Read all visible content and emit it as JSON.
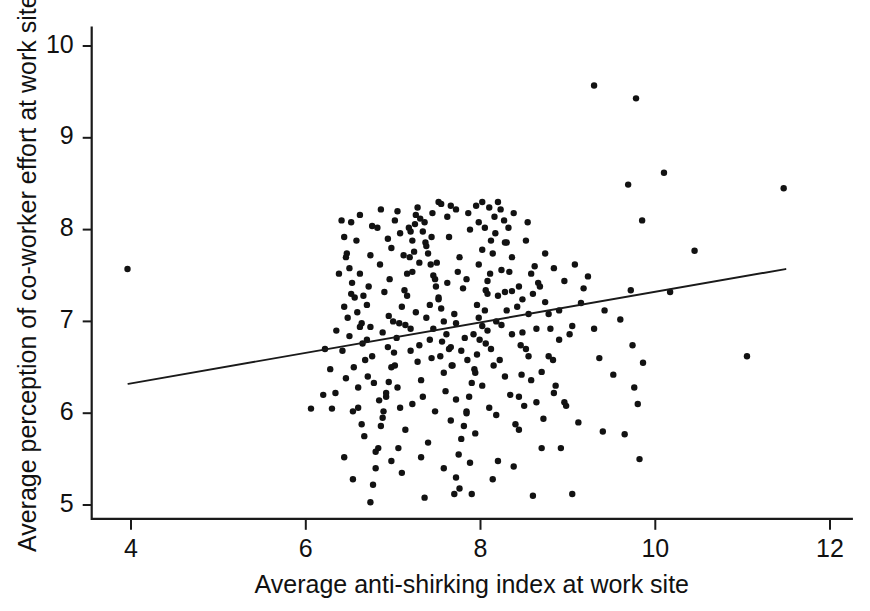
{
  "chart_data": {
    "type": "scatter",
    "title": "",
    "xlabel": "Average anti-shirking index at work site",
    "ylabel": "Average perception of co-worker effort at work site",
    "xlim": [
      3.55,
      12.25
    ],
    "ylim": [
      4.85,
      10.2
    ],
    "xticks": [
      4,
      6,
      8,
      10,
      12
    ],
    "xtick_labels": [
      "4",
      "6",
      "8",
      "10",
      "12"
    ],
    "yticks": [
      5,
      6,
      7,
      8,
      9,
      10
    ],
    "ytick_labels": [
      "5",
      "6",
      "7",
      "8",
      "9",
      "10"
    ],
    "grid": false,
    "legend": null,
    "marker": {
      "shape": "circle",
      "color": "#121212",
      "size_px": 6.4
    },
    "trendline": {
      "type": "linear",
      "color": "#1a1a1a",
      "x_start": 3.97,
      "y_start": 6.32,
      "x_end": 11.49,
      "y_end": 7.57,
      "slope": 0.166,
      "intercept": 5.66
    },
    "n_points": 305,
    "points": [
      [
        3.96,
        7.57
      ],
      [
        9.3,
        9.57
      ],
      [
        9.78,
        9.43
      ],
      [
        10.1,
        8.62
      ],
      [
        9.69,
        8.49
      ],
      [
        11.47,
        8.45
      ],
      [
        9.85,
        8.1
      ],
      [
        10.45,
        7.77
      ],
      [
        9.23,
        7.49
      ],
      [
        9.72,
        7.34
      ],
      [
        10.17,
        7.32
      ],
      [
        9.6,
        7.02
      ],
      [
        9.74,
        6.74
      ],
      [
        11.05,
        6.62
      ],
      [
        9.86,
        6.55
      ],
      [
        9.76,
        6.28
      ],
      [
        9.8,
        6.1
      ],
      [
        9.65,
        5.77
      ],
      [
        9.82,
        5.5
      ],
      [
        9.05,
        5.12
      ],
      [
        8.98,
        6.08
      ],
      [
        8.86,
        6.3
      ],
      [
        8.83,
        6.58
      ],
      [
        8.8,
        6.92
      ],
      [
        8.74,
        7.21
      ],
      [
        8.66,
        7.42
      ],
      [
        8.62,
        7.6
      ],
      [
        8.55,
        7.08
      ],
      [
        8.52,
        6.7
      ],
      [
        8.47,
        6.42
      ],
      [
        8.44,
        6.18
      ],
      [
        8.4,
        5.88
      ],
      [
        8.92,
        5.62
      ],
      [
        8.36,
        7.33
      ],
      [
        8.33,
        7.54
      ],
      [
        8.3,
        7.86
      ],
      [
        8.27,
        8.1
      ],
      [
        8.23,
        8.22
      ],
      [
        8.2,
        8.3
      ],
      [
        8.17,
        7.96
      ],
      [
        8.14,
        7.74
      ],
      [
        8.11,
        7.52
      ],
      [
        8.08,
        7.3
      ],
      [
        8.05,
        7.12
      ],
      [
        8.02,
        6.95
      ],
      [
        7.99,
        6.8
      ],
      [
        7.96,
        6.64
      ],
      [
        7.93,
        6.48
      ],
      [
        7.9,
        6.33
      ],
      [
        7.87,
        6.18
      ],
      [
        7.84,
        6.02
      ],
      [
        7.81,
        5.86
      ],
      [
        7.78,
        5.72
      ],
      [
        7.75,
        5.55
      ],
      [
        7.72,
        5.3
      ],
      [
        7.7,
        5.12
      ],
      [
        7.67,
        6.52
      ],
      [
        7.64,
        6.7
      ],
      [
        7.61,
        6.86
      ],
      [
        7.58,
        7.0
      ],
      [
        7.55,
        7.14
      ],
      [
        7.52,
        7.26
      ],
      [
        7.49,
        7.38
      ],
      [
        7.46,
        7.5
      ],
      [
        7.43,
        7.62
      ],
      [
        7.4,
        7.74
      ],
      [
        7.37,
        7.86
      ],
      [
        7.34,
        7.98
      ],
      [
        7.31,
        8.12
      ],
      [
        7.28,
        8.24
      ],
      [
        7.25,
        8.06
      ],
      [
        7.22,
        7.88
      ],
      [
        7.19,
        7.7
      ],
      [
        7.16,
        7.52
      ],
      [
        7.13,
        7.34
      ],
      [
        7.1,
        7.16
      ],
      [
        7.07,
        6.98
      ],
      [
        7.04,
        6.82
      ],
      [
        7.01,
        6.66
      ],
      [
        6.98,
        6.5
      ],
      [
        6.95,
        6.34
      ],
      [
        6.92,
        6.18
      ],
      [
        6.89,
        6.02
      ],
      [
        6.86,
        5.86
      ],
      [
        6.83,
        5.62
      ],
      [
        6.8,
        5.4
      ],
      [
        6.77,
        5.22
      ],
      [
        6.74,
        5.03
      ],
      [
        6.71,
        6.4
      ],
      [
        6.68,
        6.58
      ],
      [
        6.65,
        6.76
      ],
      [
        6.62,
        6.94
      ],
      [
        6.59,
        7.1
      ],
      [
        6.56,
        7.26
      ],
      [
        6.53,
        7.42
      ],
      [
        6.5,
        7.58
      ],
      [
        6.47,
        7.74
      ],
      [
        6.44,
        7.92
      ],
      [
        6.41,
        8.1
      ],
      [
        6.3,
        6.05
      ],
      [
        6.06,
        6.05
      ],
      [
        6.2,
        6.2
      ],
      [
        7.05,
        8.2
      ],
      [
        7.55,
        8.28
      ],
      [
        7.95,
        8.26
      ],
      [
        8.05,
        8.02
      ],
      [
        7.45,
        8.18
      ],
      [
        7.3,
        7.64
      ],
      [
        8.6,
        7.3
      ],
      [
        8.3,
        7.12
      ],
      [
        8.15,
        6.52
      ],
      [
        8.5,
        6.08
      ],
      [
        8.7,
        6.45
      ],
      [
        8.9,
        6.8
      ],
      [
        9.05,
        6.95
      ],
      [
        9.15,
        7.2
      ],
      [
        8.2,
        5.48
      ],
      [
        7.9,
        5.12
      ],
      [
        7.1,
        5.35
      ],
      [
        6.98,
        5.48
      ],
      [
        6.67,
        5.75
      ],
      [
        6.6,
        6.06
      ],
      [
        6.92,
        6.22
      ],
      [
        7.22,
        6.1
      ],
      [
        7.48,
        6.02
      ],
      [
        7.72,
        6.15
      ],
      [
        8.02,
        6.3
      ],
      [
        8.28,
        6.4
      ],
      [
        8.55,
        6.62
      ],
      [
        8.12,
        6.7
      ],
      [
        7.85,
        6.58
      ],
      [
        7.58,
        6.44
      ],
      [
        7.32,
        6.36
      ],
      [
        7.05,
        6.28
      ],
      [
        6.78,
        6.33
      ],
      [
        6.55,
        6.5
      ],
      [
        6.42,
        6.68
      ],
      [
        6.35,
        6.9
      ],
      [
        6.48,
        7.04
      ],
      [
        6.7,
        7.18
      ],
      [
        6.95,
        7.06
      ],
      [
        7.2,
        6.92
      ],
      [
        7.42,
        6.8
      ],
      [
        7.66,
        6.72
      ],
      [
        7.92,
        6.86
      ],
      [
        8.18,
        7.0
      ],
      [
        8.42,
        7.16
      ],
      [
        8.08,
        7.44
      ],
      [
        7.8,
        7.36
      ],
      [
        7.52,
        7.24
      ],
      [
        7.26,
        7.1
      ],
      [
        7.0,
        7.0
      ],
      [
        6.74,
        6.94
      ],
      [
        6.52,
        7.3
      ],
      [
        6.62,
        7.52
      ],
      [
        6.85,
        7.62
      ],
      [
        7.12,
        7.72
      ],
      [
        7.38,
        7.82
      ],
      [
        7.64,
        7.92
      ],
      [
        7.88,
        8.0
      ],
      [
        8.12,
        7.88
      ],
      [
        8.36,
        7.7
      ],
      [
        8.58,
        7.52
      ],
      [
        8.44,
        7.38
      ],
      [
        8.24,
        7.56
      ],
      [
        7.98,
        7.62
      ],
      [
        7.74,
        7.54
      ],
      [
        7.48,
        7.46
      ],
      [
        7.22,
        7.54
      ],
      [
        6.96,
        7.46
      ],
      [
        6.72,
        7.38
      ],
      [
        6.58,
        7.88
      ],
      [
        6.82,
        8.02
      ],
      [
        7.08,
        7.96
      ],
      [
        7.36,
        8.08
      ],
      [
        7.62,
        8.14
      ],
      [
        7.86,
        8.18
      ],
      [
        8.1,
        8.24
      ],
      [
        7.44,
        6.6
      ],
      [
        7.68,
        6.52
      ],
      [
        7.94,
        6.44
      ],
      [
        8.22,
        6.58
      ],
      [
        8.46,
        6.74
      ],
      [
        8.64,
        6.92
      ],
      [
        8.78,
        7.08
      ],
      [
        8.36,
        6.86
      ],
      [
        8.06,
        6.76
      ],
      [
        7.78,
        6.68
      ],
      [
        7.54,
        6.62
      ],
      [
        7.28,
        6.56
      ],
      [
        7.02,
        6.52
      ],
      [
        6.76,
        6.62
      ],
      [
        6.5,
        6.84
      ],
      [
        6.44,
        7.16
      ],
      [
        6.66,
        7.28
      ],
      [
        6.9,
        7.32
      ],
      [
        7.16,
        7.28
      ],
      [
        7.42,
        7.18
      ],
      [
        7.7,
        7.08
      ],
      [
        7.96,
        7.18
      ],
      [
        8.2,
        7.28
      ],
      [
        8.48,
        7.24
      ],
      [
        8.68,
        7.38
      ],
      [
        8.28,
        7.86
      ],
      [
        8.02,
        7.78
      ],
      [
        7.76,
        7.7
      ],
      [
        7.5,
        7.64
      ],
      [
        7.24,
        7.76
      ],
      [
        6.98,
        7.8
      ],
      [
        6.74,
        7.72
      ],
      [
        6.88,
        5.95
      ],
      [
        7.14,
        5.82
      ],
      [
        7.4,
        5.68
      ],
      [
        7.66,
        5.92
      ],
      [
        7.94,
        5.78
      ],
      [
        8.18,
        5.98
      ],
      [
        8.44,
        5.82
      ],
      [
        8.64,
        6.12
      ],
      [
        8.84,
        6.22
      ],
      [
        6.34,
        6.22
      ],
      [
        6.28,
        6.48
      ],
      [
        6.22,
        6.7
      ],
      [
        6.38,
        7.52
      ],
      [
        6.46,
        7.7
      ],
      [
        6.54,
        6.02
      ],
      [
        6.64,
        5.88
      ],
      [
        6.8,
        5.58
      ],
      [
        7.06,
        5.62
      ],
      [
        7.32,
        5.52
      ],
      [
        7.58,
        5.4
      ],
      [
        7.88,
        5.46
      ],
      [
        8.14,
        5.28
      ],
      [
        8.38,
        5.42
      ],
      [
        8.7,
        5.62
      ],
      [
        7.36,
        5.08
      ],
      [
        6.54,
        5.28
      ],
      [
        6.44,
        5.52
      ],
      [
        8.84,
        7.58
      ],
      [
        8.96,
        7.44
      ],
      [
        9.08,
        7.62
      ],
      [
        8.74,
        7.74
      ],
      [
        8.52,
        7.88
      ],
      [
        8.32,
        8.02
      ],
      [
        8.16,
        8.14
      ],
      [
        7.98,
        8.08
      ],
      [
        7.72,
        8.22
      ],
      [
        7.52,
        8.3
      ],
      [
        7.26,
        8.16
      ],
      [
        7.02,
        8.1
      ],
      [
        6.76,
        8.04
      ],
      [
        6.62,
        8.16
      ],
      [
        6.52,
        8.08
      ],
      [
        8.9,
        7.12
      ],
      [
        9.02,
        6.86
      ],
      [
        8.78,
        6.62
      ],
      [
        8.58,
        6.36
      ],
      [
        8.34,
        6.2
      ],
      [
        8.1,
        6.06
      ],
      [
        7.84,
        6.0
      ],
      [
        7.6,
        6.24
      ],
      [
        7.34,
        6.18
      ],
      [
        7.08,
        6.06
      ],
      [
        6.84,
        6.14
      ],
      [
        6.6,
        6.28
      ],
      [
        6.46,
        6.38
      ],
      [
        7.46,
        6.92
      ],
      [
        7.72,
        6.98
      ],
      [
        7.98,
        7.04
      ],
      [
        8.24,
        6.96
      ],
      [
        8.48,
        6.88
      ],
      [
        7.2,
        6.68
      ],
      [
        6.94,
        6.72
      ],
      [
        6.7,
        6.8
      ],
      [
        7.62,
        7.42
      ],
      [
        7.84,
        7.46
      ],
      [
        8.06,
        7.34
      ],
      [
        8.28,
        7.32
      ],
      [
        7.38,
        7.04
      ],
      [
        7.14,
        6.96
      ],
      [
        6.88,
        6.88
      ],
      [
        6.64,
        6.98
      ],
      [
        7.3,
        6.74
      ],
      [
        7.56,
        6.78
      ],
      [
        7.82,
        6.82
      ],
      [
        8.08,
        6.9
      ],
      [
        7.44,
        7.92
      ],
      [
        7.2,
        7.98
      ],
      [
        6.94,
        7.9
      ],
      [
        8.54,
        8.08
      ],
      [
        8.38,
        8.18
      ],
      [
        8.02,
        8.3
      ],
      [
        7.66,
        8.26
      ],
      [
        7.18,
        8.02
      ],
      [
        6.86,
        8.22
      ],
      [
        9.3,
        6.92
      ],
      [
        9.42,
        7.12
      ],
      [
        9.18,
        7.36
      ],
      [
        9.36,
        6.6
      ],
      [
        9.52,
        6.42
      ],
      [
        8.96,
        6.12
      ],
      [
        8.72,
        5.94
      ],
      [
        9.12,
        5.9
      ],
      [
        9.4,
        5.8
      ],
      [
        7.76,
        5.18
      ],
      [
        8.6,
        5.1
      ]
    ]
  }
}
